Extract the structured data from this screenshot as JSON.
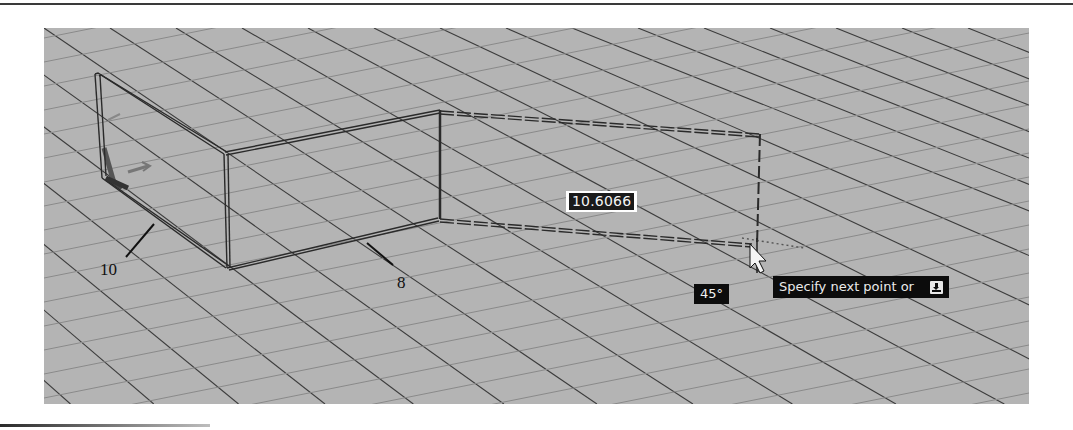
{
  "viewport": {
    "background": "#b4b4b4",
    "grid": {
      "major_color": "#3c3c3c",
      "minor_color": "#8a8a8a"
    }
  },
  "dynamic_input": {
    "length_value": "10.6066",
    "angle_value": "45°",
    "prompt_text": "Specify next point or",
    "prompt_icon": "down-arrow-options-icon"
  },
  "callouts": [
    {
      "label": "10"
    },
    {
      "label": "8"
    }
  ],
  "colors": {
    "tooltip_bg": "#0c0c0c",
    "tooltip_text": "#eaeaea",
    "dim_box_bg": "#1a1a1a",
    "dim_box_border": "#ffffff"
  }
}
